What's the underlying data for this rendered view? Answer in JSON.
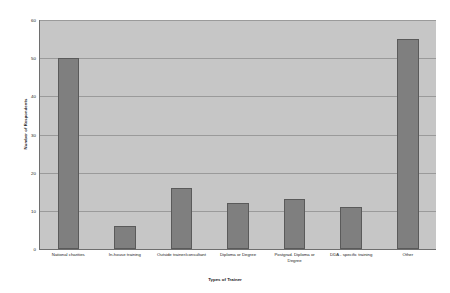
{
  "chart_data": {
    "type": "bar",
    "title": "",
    "xlabel": "Types of Trainer",
    "ylabel": "Number of Respondents",
    "categories": [
      "National charities",
      "In-house training",
      "Outside trainer/consultant",
      "Diploma or Degree",
      "Postgrad. Diploma or Degree",
      "DDA - specific training",
      "Other"
    ],
    "values": [
      50,
      6,
      16,
      12,
      13,
      11,
      55
    ],
    "ylim": [
      0,
      60
    ],
    "yticks": [
      0,
      10,
      20,
      30,
      40,
      50,
      60
    ],
    "grid": true,
    "legend": false,
    "bar_color": "#7f7f7f",
    "plot_background": "#c6c6c6",
    "figure_background": "#ffffff",
    "gridline_color": "#9a9a9a",
    "axis_color": "#6e6e6e"
  }
}
